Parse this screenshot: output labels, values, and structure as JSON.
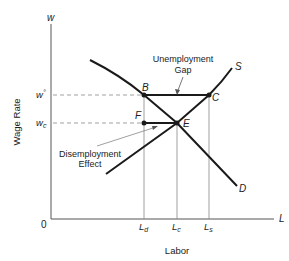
{
  "diagram": {
    "axes": {
      "y_axis_symbol": "w",
      "y_axis_title": "Wage Rate",
      "x_axis_symbol": "L",
      "x_axis_title": "Labor",
      "origin": "0"
    },
    "y_ticks": [
      {
        "label": "w°",
        "id": "w-min"
      },
      {
        "label": "wc",
        "main": "w",
        "sub": "c"
      }
    ],
    "x_ticks": [
      {
        "main": "L",
        "sub": "d"
      },
      {
        "main": "L",
        "sub": "c"
      },
      {
        "main": "L",
        "sub": "s"
      }
    ],
    "y_tick_labels": {
      "w_min_main": "w",
      "w_min_sup": "°",
      "wc_main": "w",
      "wc_sub": "c"
    },
    "x_tick_labels": {
      "ld_main": "L",
      "ld_sub": "d",
      "lc_main": "L",
      "lc_sub": "c",
      "ls_main": "L",
      "ls_sub": "s"
    },
    "curves": {
      "supply": "S",
      "demand": "D"
    },
    "points": {
      "B": "B",
      "C": "C",
      "E": "E",
      "F": "F"
    },
    "annotations": {
      "unemployment_gap_line1": "Unemployment",
      "unemployment_gap_line2": "Gap",
      "disemployment_effect_line1": "Disemployment",
      "disemployment_effect_line2": "Effect"
    },
    "colors": {
      "curve": "#1a1a1a",
      "axis": "#555555",
      "guide": "#888888"
    }
  }
}
